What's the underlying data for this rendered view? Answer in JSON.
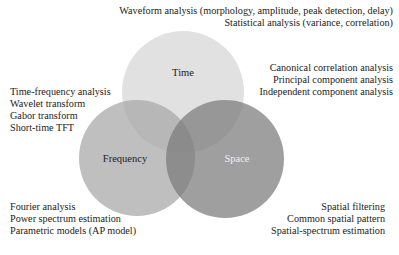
{
  "circles": {
    "time": {
      "label": "Time",
      "cx": 183,
      "cy": 92,
      "r": 61,
      "color": "#dcdcdc",
      "label_color": "#222222"
    },
    "frequency": {
      "label": "Frequency",
      "cx": 137,
      "cy": 158,
      "r": 58,
      "color": "#b4b4b4",
      "label_color": "#222222"
    },
    "space": {
      "label": "Space",
      "cx": 225,
      "cy": 159,
      "r": 59,
      "color": "#8e8e8e",
      "label_color": "#eeeeee"
    }
  },
  "annotations": {
    "time": {
      "lines": [
        "Waveform analysis (morphology, amplitude, peak detection, delay)",
        "Statistical analysis (variance, correlation)"
      ]
    },
    "multivariate": {
      "lines": [
        "Canonical correlation analysis",
        "Principal component analysis",
        "Independent component analysis"
      ]
    },
    "time_frequency": {
      "lines": [
        "Time-frequency analysis",
        "Wavelet transform",
        "Gabor transform",
        "Short-time TFT"
      ]
    },
    "frequency": {
      "lines": [
        "Fourier analysis",
        "Power spectrum estimation",
        "Parametric models (AP model)"
      ]
    },
    "space": {
      "lines": [
        "Spatial filtering",
        "Common spatial pattern",
        "Spatial-spectrum estimation"
      ]
    }
  }
}
